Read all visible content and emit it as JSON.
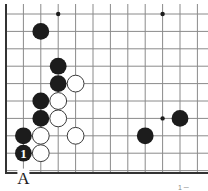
{
  "diagram": {
    "board": {
      "columns": 12,
      "rows": 10,
      "visible_edges": [
        "left",
        "bottom"
      ],
      "star_points": [
        {
          "col": 3,
          "row": 0
        },
        {
          "col": 9,
          "row": 0
        },
        {
          "col": 9,
          "row": 6
        }
      ]
    },
    "stones": [
      {
        "color": "black",
        "col": 2,
        "row": 1,
        "label": ""
      },
      {
        "color": "black",
        "col": 3,
        "row": 3,
        "label": ""
      },
      {
        "color": "black",
        "col": 3,
        "row": 4,
        "label": ""
      },
      {
        "color": "white",
        "col": 4,
        "row": 4,
        "label": ""
      },
      {
        "color": "black",
        "col": 2,
        "row": 5,
        "label": ""
      },
      {
        "color": "white",
        "col": 3,
        "row": 5,
        "label": ""
      },
      {
        "color": "black",
        "col": 2,
        "row": 6,
        "label": ""
      },
      {
        "color": "white",
        "col": 3,
        "row": 6,
        "label": ""
      },
      {
        "color": "black",
        "col": 10,
        "row": 6,
        "label": ""
      },
      {
        "color": "black",
        "col": 1,
        "row": 7,
        "label": ""
      },
      {
        "color": "white",
        "col": 2,
        "row": 7,
        "label": ""
      },
      {
        "color": "white",
        "col": 4,
        "row": 7,
        "label": ""
      },
      {
        "color": "black",
        "col": 8,
        "row": 7,
        "label": ""
      },
      {
        "color": "black",
        "col": 1,
        "row": 8,
        "label": "1"
      },
      {
        "color": "white",
        "col": 2,
        "row": 8,
        "label": ""
      }
    ],
    "point_labels": [
      {
        "text": "A",
        "col": 1,
        "row": 9
      }
    ],
    "caption": "1 ─"
  }
}
